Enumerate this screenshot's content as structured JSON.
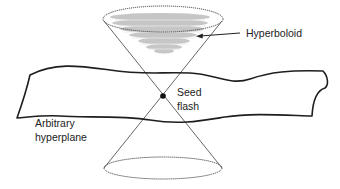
{
  "diagram": {
    "type": "spacetime light cone with hyperboloid and hyperplane",
    "labels": {
      "hyperboloid": "Hyperboloid",
      "seed_line1": "Seed",
      "seed_line2": "flash",
      "plane_line1": "Arbitrary",
      "plane_line2": "hyperplane"
    },
    "colors": {
      "line": "#2a2a2a",
      "cone_line": "#555555",
      "shading": "#b8b8b8",
      "background": "#ffffff"
    },
    "elements": [
      {
        "name": "future-cone",
        "description": "upper cone opening upward from seed flash"
      },
      {
        "name": "past-cone",
        "description": "lower cone opening downward from seed flash"
      },
      {
        "name": "hyperboloid",
        "description": "shaded bowl inside upper cone"
      },
      {
        "name": "seed-flash",
        "description": "black dot at cone apex"
      },
      {
        "name": "arbitrary-hyperplane",
        "description": "wavy band crossing the cones"
      }
    ]
  }
}
